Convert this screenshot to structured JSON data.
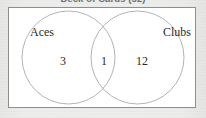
{
  "caption": {
    "text": "Deck of Cards (52)",
    "clipped": true
  },
  "diagram": {
    "type": "venn",
    "universe_label": "Deck of Cards (52)",
    "sets": [
      {
        "name": "Aces",
        "label": "Aces",
        "side": "left"
      },
      {
        "name": "Clubs",
        "label": "Clubs",
        "side": "right"
      }
    ],
    "regions": [
      {
        "name": "aces-only",
        "label": "3",
        "value": 3,
        "position": "left-only"
      },
      {
        "name": "aces-and-clubs",
        "label": "1",
        "value": 1,
        "position": "intersection"
      },
      {
        "name": "clubs-only",
        "label": "12",
        "value": 12,
        "position": "right-only"
      }
    ],
    "colors": {
      "circle_stroke": "#b4b4b4",
      "box_border": "#8e8e8e",
      "box_fill": "#ffffff",
      "page_background": "#e9e9e7",
      "text": "#2b2b2b"
    }
  }
}
